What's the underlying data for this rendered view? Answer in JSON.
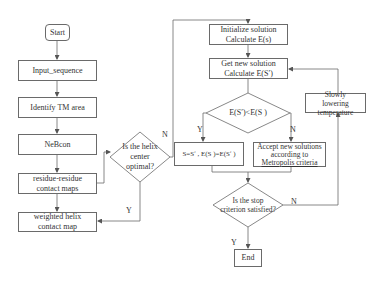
{
  "nodes": {
    "start": "Start",
    "input_sequence": "Input_sequence",
    "identify_tm": "Identify TM area",
    "nebcon": "NeBcon",
    "residue_maps": "residue-residue contact maps",
    "weighted_map": "weighted helix contact map",
    "helix_decision": "Is the helix center optimal?",
    "initialize_line1": "Initialize solution",
    "initialize_line2": "Calculate E(s)",
    "getnew_line1": "Get new solution",
    "getnew_line2": "Calculate E(Sʹ)",
    "energy_decision": "E(Sʹ)<E(S )",
    "accept_update": "S=Sʹ , E(S )=E(Sʹ )",
    "metropolis_line1": "Accept new solutions",
    "metropolis_line2": "according to",
    "metropolis_line3": "Metropolis criteria",
    "lower_temp": "Slowly lowering temperature",
    "stop_decision": "Is the stop criterion satisfied?",
    "end": "End"
  },
  "edge_labels": {
    "helix_yes": "Y",
    "helix_no": "N",
    "energy_yes": "Y",
    "energy_no": "N",
    "stop_yes": "Y",
    "stop_no": "N"
  },
  "colors": {
    "line": "#6a6a6a",
    "text": "#333333",
    "background": "#ffffff"
  }
}
